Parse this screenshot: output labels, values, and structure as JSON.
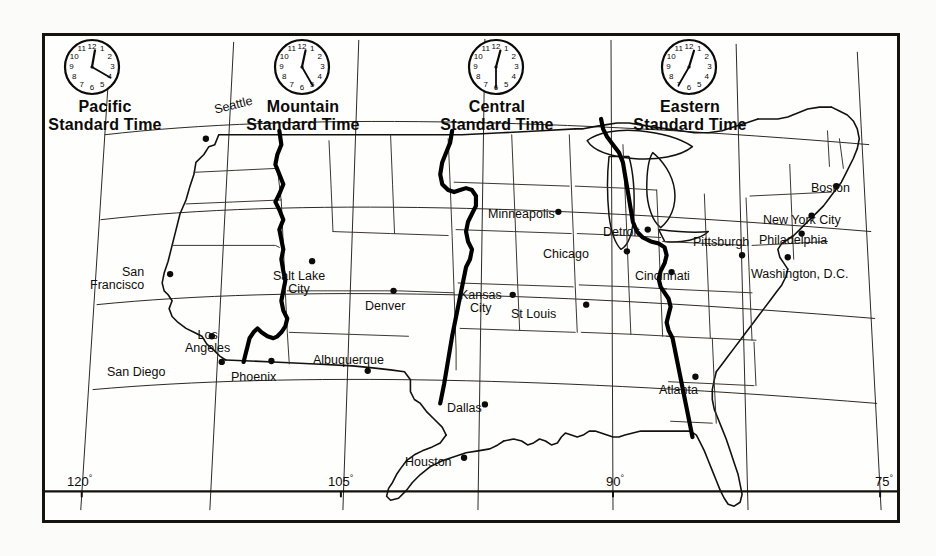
{
  "map": {
    "title": "United States Standard Time Zones",
    "frame_color": "#16130f",
    "background": "#fefefd"
  },
  "zones": [
    {
      "id": "pacific",
      "line1": "Pacific",
      "line2": "Standard Time",
      "clock_time": "12:20",
      "hour_angle": 10,
      "minute_angle": 120
    },
    {
      "id": "mountain",
      "line1": "Mountain",
      "line2": "Standard Time",
      "clock_time": "12:25",
      "hour_angle": 12,
      "minute_angle": 150
    },
    {
      "id": "central",
      "line1": "Central",
      "line2": "Standard Time",
      "clock_time": "12:30",
      "hour_angle": 15,
      "minute_angle": 180
    },
    {
      "id": "eastern",
      "line1": "Eastern",
      "line2": "Standard Time",
      "clock_time": "12:35",
      "hour_angle": 17,
      "minute_angle": 210
    }
  ],
  "clock_numerals": [
    "12",
    "1",
    "2",
    "3",
    "4",
    "5",
    "6",
    "7",
    "8",
    "9",
    "10",
    "11"
  ],
  "cities": [
    {
      "name": "Seattle",
      "label": "Seattle",
      "zone": "pacific"
    },
    {
      "name": "San Francisco",
      "label": "San\nFrancisco",
      "line1": "San",
      "line2": "Francisco",
      "zone": "pacific"
    },
    {
      "name": "Los Angeles",
      "label": "Los\nAngeles",
      "line1": "Los",
      "line2": "Angeles",
      "zone": "pacific"
    },
    {
      "name": "San Diego",
      "label": "San Diego",
      "zone": "pacific"
    },
    {
      "name": "Salt Lake City",
      "label": "Salt Lake\nCity",
      "line1": "Salt Lake",
      "line2": "City",
      "zone": "mountain"
    },
    {
      "name": "Denver",
      "label": "Denver",
      "zone": "mountain"
    },
    {
      "name": "Phoenix",
      "label": "Phoenix",
      "zone": "mountain"
    },
    {
      "name": "Albuquerque",
      "label": "Albuquerque",
      "zone": "mountain"
    },
    {
      "name": "Minneapolis",
      "label": "Minneapolis",
      "zone": "central"
    },
    {
      "name": "Chicago",
      "label": "Chicago",
      "zone": "central"
    },
    {
      "name": "Kansas City",
      "label": "Kansas\nCity",
      "line1": "Kansas",
      "line2": "City",
      "zone": "central"
    },
    {
      "name": "St Louis",
      "label": "St Louis",
      "zone": "central"
    },
    {
      "name": "Dallas",
      "label": "Dallas",
      "zone": "central"
    },
    {
      "name": "Houston",
      "label": "Houston",
      "zone": "central"
    },
    {
      "name": "Detroit",
      "label": "Detroit",
      "zone": "eastern"
    },
    {
      "name": "Cincinnati",
      "label": "Cincinnati",
      "zone": "eastern"
    },
    {
      "name": "Pittsburgh",
      "label": "Pittsburgh",
      "zone": "eastern"
    },
    {
      "name": "Atlanta",
      "label": "Atlanta",
      "zone": "eastern"
    },
    {
      "name": "Boston",
      "label": "Boston",
      "zone": "eastern"
    },
    {
      "name": "New York City",
      "label": "New York City",
      "zone": "eastern"
    },
    {
      "name": "Philadelphia",
      "label": "Philadelphia",
      "zone": "eastern"
    },
    {
      "name": "Washington DC",
      "label": "Washington, D.C.",
      "zone": "eastern"
    }
  ],
  "longitudes": [
    {
      "value": "120",
      "degree": "°"
    },
    {
      "value": "105",
      "degree": "°"
    },
    {
      "value": "90",
      "degree": "°"
    },
    {
      "value": "75",
      "degree": "°"
    }
  ]
}
